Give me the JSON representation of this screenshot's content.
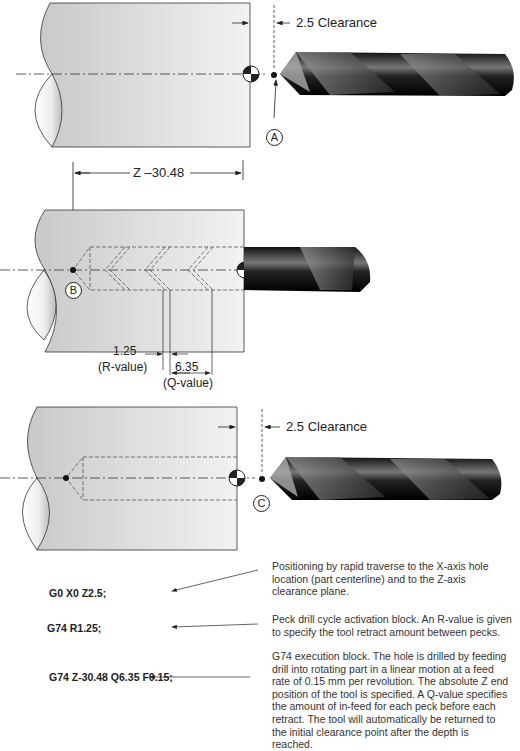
{
  "panels": [
    {
      "id": "A",
      "clearance_label": "2.5 Clearance",
      "point_label": "A"
    },
    {
      "id": "B",
      "dimension_label": "Z –30.48",
      "point_label": "B",
      "r_value": "1.25",
      "r_label": "(R-value)",
      "q_value": "6.35",
      "q_label": "(Q-value)"
    },
    {
      "id": "C",
      "clearance_label": "2.5 Clearance",
      "point_label": "C"
    }
  ],
  "program": [
    {
      "code": "G0 X0 Z2.5;",
      "description": "Positioning by rapid traverse to the X-axis hole location (part centerline) and to the Z-axis clearance plane."
    },
    {
      "code": "G74 R1.25;",
      "description": "Peck drill cycle activation block. An R-value is given to specify the tool retract amount between pecks."
    },
    {
      "code": "G74 Z-30.48 Q6.35 F0.15;",
      "description": "G74 execution block. The hole is drilled by feeding drill into rotating part in a linear motion at a feed rate of 0.15 mm per revolution. The absolute Z end position of the tool is specified. A Q-value specifies the amount of in-feed for each peck before each retract. The tool will automatically be returned to the initial clearance point after the depth is reached."
    }
  ],
  "footer_partial": "G74 peck drilling example"
}
